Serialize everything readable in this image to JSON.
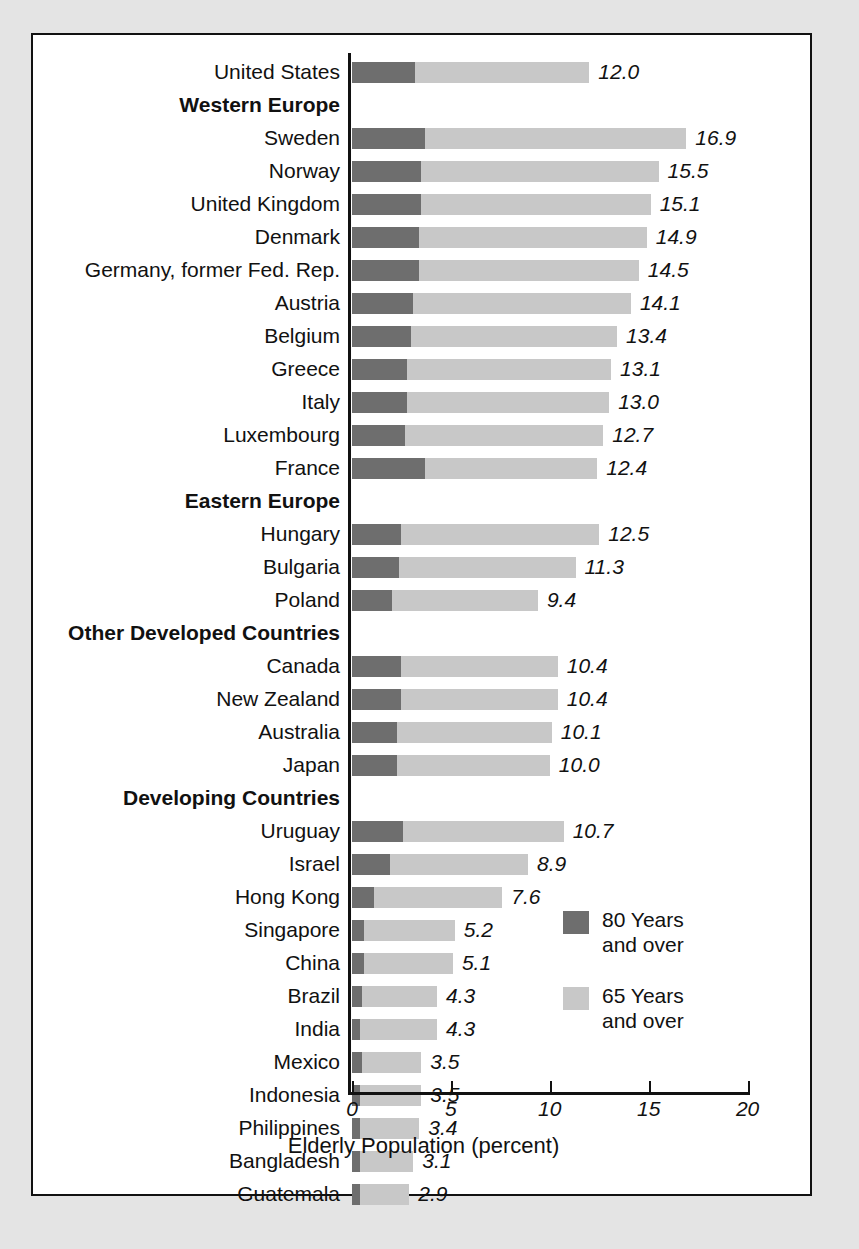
{
  "chart_data": {
    "type": "bar",
    "orientation": "horizontal",
    "stacked": true,
    "title": "",
    "xlabel": "Elderly Population (percent)",
    "ylabel": "",
    "xlim": [
      0,
      20
    ],
    "xticks": [
      0,
      5,
      10,
      15,
      20
    ],
    "xticklabels": [
      "0",
      "5",
      "10",
      "15",
      "20"
    ],
    "grid": false,
    "legend": {
      "position": "inside-bottom-right",
      "entries": [
        {
          "label": "80 Years\nand over",
          "color": "#6e6e6e",
          "key": "80plus"
        },
        {
          "label": "65 Years\nand over",
          "color": "#c8c8c8",
          "key": "65plus"
        }
      ]
    },
    "series": [
      {
        "name": "80 Years and over",
        "color": "#6e6e6e"
      },
      {
        "name": "65 Years and over",
        "color": "#c8c8c8"
      }
    ],
    "rows": [
      {
        "label": "United States",
        "type": "country",
        "value": 12.0,
        "value_label": "12.0",
        "dark": 3.2
      },
      {
        "label": "Western Europe",
        "type": "group"
      },
      {
        "label": "Sweden",
        "type": "country",
        "value": 16.9,
        "value_label": "16.9",
        "dark": 3.7
      },
      {
        "label": "Norway",
        "type": "country",
        "value": 15.5,
        "value_label": "15.5",
        "dark": 3.5
      },
      {
        "label": "United Kingdom",
        "type": "country",
        "value": 15.1,
        "value_label": "15.1",
        "dark": 3.5
      },
      {
        "label": "Denmark",
        "type": "country",
        "value": 14.9,
        "value_label": "14.9",
        "dark": 3.4
      },
      {
        "label": "Germany, former Fed. Rep.",
        "type": "country",
        "value": 14.5,
        "value_label": "14.5",
        "dark": 3.4
      },
      {
        "label": "Austria",
        "type": "country",
        "value": 14.1,
        "value_label": "14.1",
        "dark": 3.1
      },
      {
        "label": "Belgium",
        "type": "country",
        "value": 13.4,
        "value_label": "13.4",
        "dark": 3.0
      },
      {
        "label": "Greece",
        "type": "country",
        "value": 13.1,
        "value_label": "13.1",
        "dark": 2.8
      },
      {
        "label": "Italy",
        "type": "country",
        "value": 13.0,
        "value_label": "13.0",
        "dark": 2.8
      },
      {
        "label": "Luxembourg",
        "type": "country",
        "value": 12.7,
        "value_label": "12.7",
        "dark": 2.7
      },
      {
        "label": "France",
        "type": "country",
        "value": 12.4,
        "value_label": "12.4",
        "dark": 3.7
      },
      {
        "label": "Eastern Europe",
        "type": "group"
      },
      {
        "label": "Hungary",
        "type": "country",
        "value": 12.5,
        "value_label": "12.5",
        "dark": 2.5
      },
      {
        "label": "Bulgaria",
        "type": "country",
        "value": 11.3,
        "value_label": "11.3",
        "dark": 2.4
      },
      {
        "label": "Poland",
        "type": "country",
        "value": 9.4,
        "value_label": "9.4",
        "dark": 2.0
      },
      {
        "label": "Other Developed Countries",
        "type": "group"
      },
      {
        "label": "Canada",
        "type": "country",
        "value": 10.4,
        "value_label": "10.4",
        "dark": 2.5
      },
      {
        "label": "New Zealand",
        "type": "country",
        "value": 10.4,
        "value_label": "10.4",
        "dark": 2.5
      },
      {
        "label": "Australia",
        "type": "country",
        "value": 10.1,
        "value_label": "10.1",
        "dark": 2.3
      },
      {
        "label": "Japan",
        "type": "country",
        "value": 10.0,
        "value_label": "10.0",
        "dark": 2.3
      },
      {
        "label": "Developing Countries",
        "type": "group"
      },
      {
        "label": "Uruguay",
        "type": "country",
        "value": 10.7,
        "value_label": "10.7",
        "dark": 2.6
      },
      {
        "label": "Israel",
        "type": "country",
        "value": 8.9,
        "value_label": "8.9",
        "dark": 1.9
      },
      {
        "label": "Hong Kong",
        "type": "country",
        "value": 7.6,
        "value_label": "7.6",
        "dark": 1.1
      },
      {
        "label": "Singapore",
        "type": "country",
        "value": 5.2,
        "value_label": "5.2",
        "dark": 0.6
      },
      {
        "label": "China",
        "type": "country",
        "value": 5.1,
        "value_label": "5.1",
        "dark": 0.6
      },
      {
        "label": "Brazil",
        "type": "country",
        "value": 4.3,
        "value_label": "4.3",
        "dark": 0.5
      },
      {
        "label": "India",
        "type": "country",
        "value": 4.3,
        "value_label": "4.3",
        "dark": 0.4
      },
      {
        "label": "Mexico",
        "type": "country",
        "value": 3.5,
        "value_label": "3.5",
        "dark": 0.5
      },
      {
        "label": "Indonesia",
        "type": "country",
        "value": 3.5,
        "value_label": "3.5",
        "dark": 0.4
      },
      {
        "label": "Philippines",
        "type": "country",
        "value": 3.4,
        "value_label": "3.4",
        "dark": 0.4
      },
      {
        "label": "Bangladesh",
        "type": "country",
        "value": 3.1,
        "value_label": "3.1",
        "dark": 0.4
      },
      {
        "label": "Guatemala",
        "type": "country",
        "value": 2.9,
        "value_label": "2.9",
        "dark": 0.4
      }
    ]
  },
  "colors": {
    "dark_segment": "#6e6e6e",
    "light_segment": "#c8c8c8",
    "frame_border": "#111111",
    "page_background": "#e4e4e4",
    "panel_background": "#ffffff"
  }
}
